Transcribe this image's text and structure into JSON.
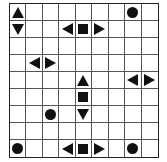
{
  "board": {
    "rows": 9,
    "cols": 9,
    "line_color": "#555555",
    "piece_color": "#111111",
    "pieces": [
      {
        "row": 0,
        "col": 0,
        "shape": "triangle-up"
      },
      {
        "row": 0,
        "col": 7,
        "shape": "circle"
      },
      {
        "row": 1,
        "col": 0,
        "shape": "triangle-down"
      },
      {
        "row": 1,
        "col": 3,
        "shape": "triangle-left"
      },
      {
        "row": 1,
        "col": 4,
        "shape": "square"
      },
      {
        "row": 1,
        "col": 5,
        "shape": "triangle-right"
      },
      {
        "row": 3,
        "col": 1,
        "shape": "triangle-left"
      },
      {
        "row": 3,
        "col": 2,
        "shape": "triangle-right"
      },
      {
        "row": 4,
        "col": 4,
        "shape": "triangle-up"
      },
      {
        "row": 4,
        "col": 7,
        "shape": "triangle-left"
      },
      {
        "row": 4,
        "col": 8,
        "shape": "triangle-right"
      },
      {
        "row": 5,
        "col": 4,
        "shape": "square"
      },
      {
        "row": 6,
        "col": 2,
        "shape": "circle"
      },
      {
        "row": 6,
        "col": 4,
        "shape": "triangle-down"
      },
      {
        "row": 8,
        "col": 0,
        "shape": "circle"
      },
      {
        "row": 8,
        "col": 3,
        "shape": "triangle-left"
      },
      {
        "row": 8,
        "col": 4,
        "shape": "square"
      },
      {
        "row": 8,
        "col": 5,
        "shape": "triangle-right"
      },
      {
        "row": 8,
        "col": 7,
        "shape": "circle"
      }
    ]
  }
}
